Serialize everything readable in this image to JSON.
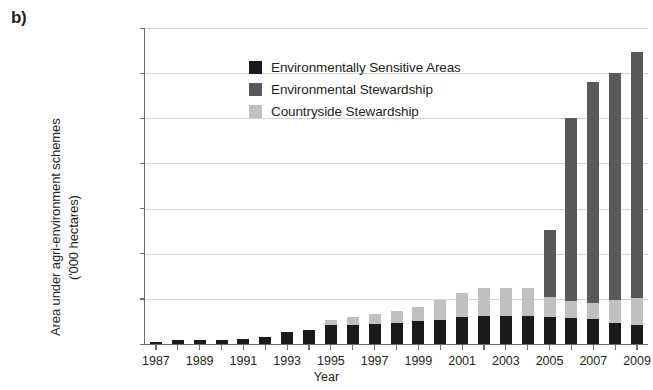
{
  "figure": {
    "panel_label": "b)"
  },
  "chart_data": {
    "type": "bar",
    "stacked": true,
    "title": "",
    "xlabel": "Year",
    "ylabel": "Area under agri-environment schemes",
    "ylabel_unit": "('000 hectares)",
    "ylim": [
      0,
      7000
    ],
    "ytick_values": [
      0,
      1000,
      2000,
      3000,
      4000,
      5000,
      6000,
      7000
    ],
    "ytick_labels": [
      "0",
      "1,000",
      "2,000",
      "3,000",
      "4,000",
      "5,000",
      "6,000",
      "7,000"
    ],
    "grid": true,
    "grid_axis": "y",
    "legend_position": "upper-center-left",
    "categories": [
      "1987",
      "1988",
      "1989",
      "1990",
      "1991",
      "1992",
      "1993",
      "1994",
      "1995",
      "1996",
      "1997",
      "1998",
      "1999",
      "2000",
      "2001",
      "2002",
      "2003",
      "2004",
      "2005",
      "2006",
      "2007",
      "2008",
      "2009"
    ],
    "xtick_labels_shown": [
      "1987",
      "1989",
      "1991",
      "1993",
      "1995",
      "1997",
      "1999",
      "2001",
      "2003",
      "2005",
      "2007",
      "2009"
    ],
    "series": [
      {
        "name": "Environmentally Sensitive Areas",
        "color": "#1a1a1a",
        "values": [
          40,
          90,
          100,
          95,
          115,
          150,
          270,
          320,
          420,
          430,
          440,
          470,
          500,
          540,
          590,
          620,
          620,
          610,
          590,
          580,
          560,
          470,
          430
        ]
      },
      {
        "name": "Environmental Stewardship",
        "color": "#595959",
        "values": [
          0,
          0,
          0,
          0,
          0,
          0,
          0,
          0,
          0,
          0,
          0,
          0,
          0,
          0,
          0,
          0,
          0,
          0,
          1480,
          4050,
          4890,
          5020,
          5450
        ]
      },
      {
        "name": "Countryside Stewardship",
        "color": "#c0c0c0",
        "values": [
          0,
          0,
          0,
          0,
          0,
          0,
          0,
          0,
          110,
          160,
          230,
          270,
          320,
          430,
          540,
          620,
          630,
          640,
          450,
          380,
          350,
          510,
          580
        ]
      }
    ],
    "stack_order": [
      "Environmentally Sensitive Areas",
      "Countryside Stewardship",
      "Environmental Stewardship"
    ],
    "totals": [
      40,
      90,
      100,
      95,
      115,
      150,
      270,
      320,
      530,
      590,
      670,
      740,
      820,
      970,
      1130,
      1240,
      1250,
      1250,
      2520,
      5010,
      5800,
      6000,
      6460
    ]
  }
}
